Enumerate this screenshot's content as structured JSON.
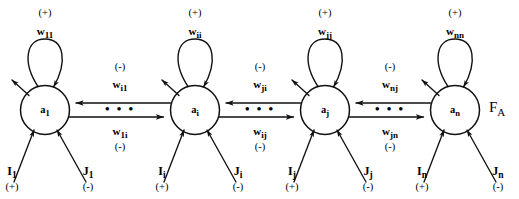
{
  "figure": {
    "type": "neural-network-architecture-diagram",
    "field_label": "F",
    "field_label_sub": "A",
    "ellipsis": "• • •",
    "sign_positive": "(+)",
    "sign_negative": "(-)"
  },
  "nodes": [
    {
      "id": "node-1",
      "activation": "a",
      "activation_sub": "1",
      "cx": 45,
      "cy": 110,
      "self_weight": "w",
      "self_weight_sub": "11",
      "self_sign": "(+)",
      "input_excitatory": "I",
      "input_excitatory_sub": "1",
      "input_excitatory_sign": "(+)",
      "input_inhibitory": "J",
      "input_inhibitory_sub": "1",
      "input_inhibitory_sign": "(-)"
    },
    {
      "id": "node-i",
      "activation": "a",
      "activation_sub": "i",
      "cx": 195,
      "cy": 110,
      "self_weight": "w",
      "self_weight_sub": "ii",
      "self_sign": "(+)",
      "input_excitatory": "I",
      "input_excitatory_sub": "i",
      "input_excitatory_sign": "(+)",
      "input_inhibitory": "J",
      "input_inhibitory_sub": "i",
      "input_inhibitory_sign": "(-)"
    },
    {
      "id": "node-j",
      "activation": "a",
      "activation_sub": "j",
      "cx": 325,
      "cy": 110,
      "self_weight": "w",
      "self_weight_sub": "jj",
      "self_sign": "(+)",
      "input_excitatory": "I",
      "input_excitatory_sub": "j",
      "input_excitatory_sign": "(+)",
      "input_inhibitory": "J",
      "input_inhibitory_sub": "j",
      "input_inhibitory_sign": "(-)"
    },
    {
      "id": "node-n",
      "activation": "a",
      "activation_sub": "n",
      "cx": 455,
      "cy": 110,
      "self_weight": "w",
      "self_weight_sub": "nn",
      "self_sign": "(+)",
      "input_excitatory": "I",
      "input_excitatory_sub": "n",
      "input_excitatory_sign": "(+)",
      "input_inhibitory": "J",
      "input_inhibitory_sub": "n",
      "input_inhibitory_sign": "(-)"
    }
  ],
  "connections": [
    {
      "id": "gap-1-i",
      "mid_x": 120,
      "top_weight": "w",
      "top_weight_sub": "i1",
      "top_sign": "(-)",
      "bottom_weight": "w",
      "bottom_weight_sub": "1i",
      "bottom_sign": "(-)"
    },
    {
      "id": "gap-i-j",
      "mid_x": 260,
      "top_weight": "w",
      "top_weight_sub": "ji",
      "top_sign": "(-)",
      "bottom_weight": "w",
      "bottom_weight_sub": "ij",
      "bottom_sign": "(-)"
    },
    {
      "id": "gap-j-n",
      "mid_x": 390,
      "top_weight": "w",
      "top_weight_sub": "nj",
      "top_sign": "(-)",
      "bottom_weight": "w",
      "bottom_weight_sub": "jn",
      "bottom_sign": "(-)"
    }
  ]
}
